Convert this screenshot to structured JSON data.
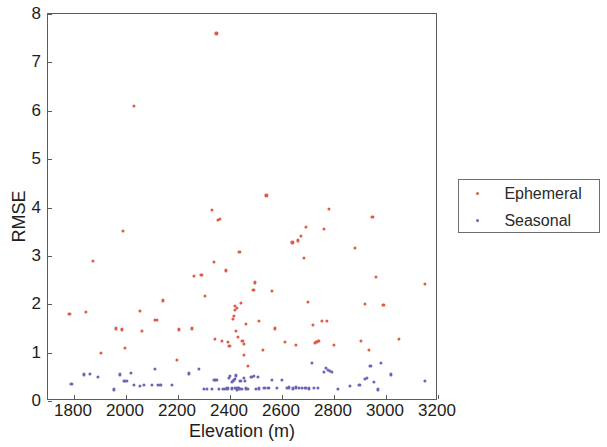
{
  "chart_data": {
    "type": "scatter",
    "title": "",
    "xlabel": "Elevation (m)",
    "ylabel": "RMSE",
    "xlim": [
      1700,
      3200
    ],
    "ylim": [
      0,
      8
    ],
    "xticks": [
      1800,
      2000,
      2200,
      2400,
      2600,
      2800,
      3000,
      3200
    ],
    "yticks": [
      0,
      1,
      2,
      3,
      4,
      5,
      6,
      7,
      8
    ],
    "grid": false,
    "legend_position": "right-outside",
    "series": [
      {
        "name": "Ephemeral",
        "color": "#e05a47",
        "marker": "dot",
        "points": [
          [
            1782,
            1.8
          ],
          [
            1846,
            1.85
          ],
          [
            1873,
            2.9
          ],
          [
            1905,
            1.0
          ],
          [
            1962,
            1.5
          ],
          [
            1985,
            1.48
          ],
          [
            1988,
            3.52
          ],
          [
            1995,
            1.1
          ],
          [
            2030,
            6.1
          ],
          [
            2053,
            1.87
          ],
          [
            2060,
            1.45
          ],
          [
            2112,
            1.68
          ],
          [
            2118,
            1.67
          ],
          [
            2143,
            2.08
          ],
          [
            2196,
            0.85
          ],
          [
            2203,
            1.48
          ],
          [
            2252,
            1.5
          ],
          [
            2262,
            2.58
          ],
          [
            2290,
            2.6
          ],
          [
            2305,
            2.18
          ],
          [
            2330,
            3.95
          ],
          [
            2338,
            2.88
          ],
          [
            2343,
            1.28
          ],
          [
            2348,
            7.6
          ],
          [
            2352,
            3.75
          ],
          [
            2360,
            3.76
          ],
          [
            2368,
            1.24
          ],
          [
            2383,
            2.7
          ],
          [
            2392,
            1.22
          ],
          [
            2398,
            1.14
          ],
          [
            2410,
            1.7
          ],
          [
            2414,
            1.76
          ],
          [
            2418,
            1.88
          ],
          [
            2420,
            1.96
          ],
          [
            2424,
            1.45
          ],
          [
            2428,
            1.92
          ],
          [
            2430,
            1.33
          ],
          [
            2436,
            3.08
          ],
          [
            2442,
            2.02
          ],
          [
            2448,
            1.24
          ],
          [
            2452,
            1.18
          ],
          [
            2455,
            0.96
          ],
          [
            2462,
            1.6
          ],
          [
            2470,
            0.72
          ],
          [
            2490,
            2.3
          ],
          [
            2496,
            2.45
          ],
          [
            2512,
            1.65
          ],
          [
            2528,
            1.05
          ],
          [
            2540,
            4.25
          ],
          [
            2560,
            2.27
          ],
          [
            2572,
            1.5
          ],
          [
            2612,
            1.22
          ],
          [
            2640,
            3.28
          ],
          [
            2652,
            1.16
          ],
          [
            2660,
            3.32
          ],
          [
            2672,
            3.42
          ],
          [
            2684,
            2.96
          ],
          [
            2692,
            3.6
          ],
          [
            2700,
            2.05
          ],
          [
            2718,
            1.58
          ],
          [
            2726,
            1.2
          ],
          [
            2732,
            1.22
          ],
          [
            2740,
            1.24
          ],
          [
            2752,
            1.65
          ],
          [
            2762,
            3.55
          ],
          [
            2772,
            1.66
          ],
          [
            2780,
            3.97
          ],
          [
            2800,
            1.16
          ],
          [
            2880,
            3.17
          ],
          [
            2905,
            1.24
          ],
          [
            2920,
            2.0
          ],
          [
            2935,
            1.05
          ],
          [
            2948,
            3.8
          ],
          [
            2960,
            2.56
          ],
          [
            2990,
            1.99
          ],
          [
            3050,
            1.28
          ],
          [
            3150,
            2.42
          ]
        ]
      },
      {
        "name": "Seasonal",
        "color": "#6a66b4",
        "marker": "dot",
        "points": [
          [
            1790,
            0.35
          ],
          [
            1838,
            0.55
          ],
          [
            1862,
            0.56
          ],
          [
            1892,
            0.5
          ],
          [
            1955,
            0.24
          ],
          [
            1978,
            0.55
          ],
          [
            1992,
            0.42
          ],
          [
            1996,
            0.41
          ],
          [
            2004,
            0.42
          ],
          [
            2018,
            0.58
          ],
          [
            2030,
            0.33
          ],
          [
            2052,
            0.32
          ],
          [
            2070,
            0.33
          ],
          [
            2100,
            0.33
          ],
          [
            2112,
            0.66
          ],
          [
            2122,
            0.33
          ],
          [
            2132,
            0.33
          ],
          [
            2176,
            0.33
          ],
          [
            2200,
            0.0
          ],
          [
            2242,
            0.57
          ],
          [
            2258,
            0.0
          ],
          [
            2280,
            0.66
          ],
          [
            2300,
            0.25
          ],
          [
            2310,
            0.25
          ],
          [
            2330,
            0.25
          ],
          [
            2340,
            0.44
          ],
          [
            2348,
            0.44
          ],
          [
            2358,
            0.25
          ],
          [
            2366,
            0.0
          ],
          [
            2372,
            0.25
          ],
          [
            2380,
            0.25
          ],
          [
            2390,
            0.26
          ],
          [
            2396,
            0.47
          ],
          [
            2400,
            0.52
          ],
          [
            2406,
            0.4
          ],
          [
            2408,
            0.26
          ],
          [
            2412,
            0.42
          ],
          [
            2415,
            0.44
          ],
          [
            2418,
            0.46
          ],
          [
            2420,
            0.27
          ],
          [
            2422,
            0.53
          ],
          [
            2425,
            0.24
          ],
          [
            2428,
            0.27
          ],
          [
            2432,
            0.27
          ],
          [
            2436,
            0.25
          ],
          [
            2440,
            0.42
          ],
          [
            2446,
            0.25
          ],
          [
            2452,
            0.48
          ],
          [
            2458,
            0.42
          ],
          [
            2462,
            0.26
          ],
          [
            2470,
            0.25
          ],
          [
            2482,
            0.5
          ],
          [
            2492,
            0.52
          ],
          [
            2500,
            0.25
          ],
          [
            2508,
            0.5
          ],
          [
            2512,
            0.26
          ],
          [
            2532,
            0.27
          ],
          [
            2548,
            0.27
          ],
          [
            2560,
            0.44
          ],
          [
            2580,
            0.27
          ],
          [
            2600,
            0.43
          ],
          [
            2618,
            0.27
          ],
          [
            2628,
            0.28
          ],
          [
            2642,
            0.26
          ],
          [
            2652,
            0.28
          ],
          [
            2664,
            0.27
          ],
          [
            2676,
            0.27
          ],
          [
            2690,
            0.27
          ],
          [
            2702,
            0.26
          ],
          [
            2716,
            0.78
          ],
          [
            2724,
            0.27
          ],
          [
            2738,
            0.27
          ],
          [
            2760,
            0.6
          ],
          [
            2770,
            0.68
          ],
          [
            2778,
            0.64
          ],
          [
            2784,
            0.62
          ],
          [
            2792,
            0.6
          ],
          [
            2816,
            0.25
          ],
          [
            2860,
            0.32
          ],
          [
            2898,
            0.33
          ],
          [
            2918,
            0.45
          ],
          [
            2928,
            0.48
          ],
          [
            2940,
            0.72
          ],
          [
            2952,
            0.4
          ],
          [
            2968,
            0.24
          ],
          [
            2980,
            0.78
          ],
          [
            3020,
            0.55
          ],
          [
            3150,
            0.42
          ]
        ]
      }
    ]
  },
  "legend": {
    "items": [
      {
        "label": "Ephemeral",
        "color": "#e05a47"
      },
      {
        "label": "Seasonal",
        "color": "#6a66b4"
      }
    ]
  },
  "axes": {
    "x_title": "Elevation (m)",
    "y_title": "RMSE",
    "x_tick_labels": [
      "1800",
      "2000",
      "2200",
      "2400",
      "2600",
      "2800",
      "3000",
      "3200"
    ],
    "y_tick_labels": [
      "0",
      "1",
      "2",
      "3",
      "4",
      "5",
      "6",
      "7",
      "8"
    ]
  }
}
